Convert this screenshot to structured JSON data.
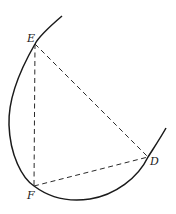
{
  "diagram": {
    "type": "geometry",
    "points": [
      {
        "name": "E",
        "label": "E",
        "x": 35,
        "y": 44
      },
      {
        "name": "F",
        "label": "F",
        "x": 34,
        "y": 186
      },
      {
        "name": "D",
        "label": "D",
        "x": 148,
        "y": 157
      }
    ],
    "segments": [
      {
        "from": "E",
        "to": "F",
        "style": "dashed"
      },
      {
        "from": "E",
        "to": "D",
        "style": "dashed"
      },
      {
        "from": "F",
        "to": "D",
        "style": "dashed"
      }
    ],
    "curve": {
      "style": "solid",
      "passes_through": [
        "E",
        "F",
        "D"
      ]
    }
  }
}
